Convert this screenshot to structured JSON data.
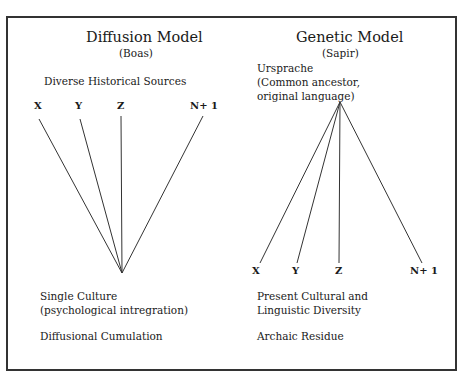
{
  "left_panel": {
    "title": "Diffusion Model",
    "subtitle": "(Boas)",
    "top_label": "Diverse Historical Sources",
    "nodes": [
      "X",
      "Y",
      "Z",
      "N+ 1"
    ],
    "bottom_label_line1": "Single Culture",
    "bottom_label_line2": "(psychological intregration)",
    "process_label": "Diffusional Cumulation"
  },
  "right_panel": {
    "title": "Genetic Model",
    "subtitle": "(Sapir)",
    "top_label_line1": "Ursprache",
    "top_label_line2": "(Common ancestor,",
    "top_label_line3": "original language)",
    "nodes": [
      "X",
      "Y",
      "Z",
      "N+ 1"
    ],
    "bottom_label_line1": "Present Cultural and",
    "bottom_label_line2": "Linguistic Diversity",
    "process_label": "Archaic Residue"
  },
  "colors": {
    "line": "#333333",
    "text": "#1a1a1a",
    "border": "#333333"
  }
}
